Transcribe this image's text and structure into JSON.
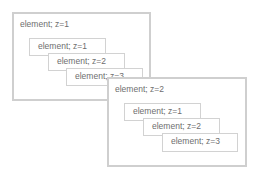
{
  "diagram": {
    "colors": {
      "border": "#cfcfcf",
      "text": "#6e6e6e",
      "background": "#ffffff"
    },
    "groups": [
      {
        "label": "element; z=1",
        "children": [
          {
            "label": "element; z=1"
          },
          {
            "label": "element; z=2"
          },
          {
            "label": "element; z=3"
          }
        ]
      },
      {
        "label": "element; z=2",
        "children": [
          {
            "label": "element; z=1"
          },
          {
            "label": "element; z=2"
          },
          {
            "label": "element; z=3"
          }
        ]
      }
    ]
  }
}
